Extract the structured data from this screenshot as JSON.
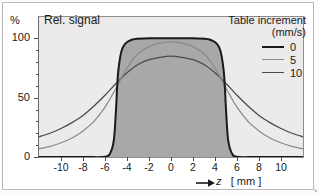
{
  "figure": {
    "y_unit_label": "%",
    "plot_title": "Rel. signal",
    "x_axis_title_symbol": "z",
    "x_axis_title_unit": "[ mm ]",
    "corner_mark": "a"
  },
  "legend": {
    "title": "Table increment",
    "unit": "(mm/s)",
    "entries": [
      {
        "label": "0",
        "color": "#1a1a1a",
        "width": 2.1
      },
      {
        "label": "5",
        "color": "#8a8a8a",
        "width": 1.5
      },
      {
        "label": "10",
        "color": "#4a4a4a",
        "width": 1.5
      }
    ]
  },
  "chart_data": {
    "type": "line",
    "title": "Rel. signal",
    "xlabel": "z [ mm ]",
    "ylabel": "%",
    "xlim": [
      -12,
      12
    ],
    "ylim": [
      0,
      118
    ],
    "grid": false,
    "legend_position": "top-right",
    "legend_title": "Table increment (mm/s)",
    "x_ticks": [
      -10,
      -8,
      -6,
      -4,
      -2,
      0,
      2,
      4,
      6,
      8,
      10
    ],
    "y_ticks": [
      0,
      50,
      100
    ],
    "y_minor_ticks": [
      10,
      20,
      30,
      40,
      60,
      70,
      80,
      90
    ],
    "fill_series": "0",
    "fill_color": "#a8a8a8",
    "panel_background": "#eceaea",
    "series": [
      {
        "name": "0",
        "color": "#1a1a1a",
        "x": [
          -12,
          -8,
          -6.2,
          -5.6,
          -5.2,
          -5.0,
          -4.8,
          -4.4,
          -3.5,
          -2,
          0,
          2,
          3.5,
          4.4,
          4.8,
          5.0,
          5.2,
          5.6,
          6.2,
          8,
          12
        ],
        "y": [
          0,
          0,
          0,
          2,
          14,
          40,
          72,
          92,
          99,
          100,
          100,
          100,
          99,
          92,
          72,
          40,
          14,
          2,
          0,
          0,
          0
        ]
      },
      {
        "name": "5",
        "color": "#8a8a8a",
        "x": [
          -12,
          -11,
          -10,
          -9,
          -8,
          -7,
          -6,
          -5,
          -4,
          -3,
          -2,
          -1,
          0,
          1,
          2,
          3,
          4,
          5,
          6,
          7,
          8,
          9,
          10,
          11,
          12
        ],
        "y": [
          7,
          9,
          12,
          16,
          22,
          30,
          42,
          58,
          75,
          87,
          93,
          96,
          97,
          96,
          93,
          87,
          75,
          58,
          42,
          30,
          22,
          16,
          12,
          9,
          7
        ]
      },
      {
        "name": "10",
        "color": "#4a4a4a",
        "x": [
          -12,
          -11,
          -10,
          -9,
          -8,
          -7,
          -6,
          -5,
          -4,
          -3,
          -2,
          -1,
          0,
          1,
          2,
          3,
          4,
          5,
          6,
          7,
          8,
          9,
          10,
          11,
          12
        ],
        "y": [
          17,
          20,
          24,
          29,
          35,
          43,
          52,
          62,
          71,
          78,
          82,
          84,
          85,
          84,
          82,
          78,
          71,
          62,
          52,
          43,
          35,
          29,
          24,
          20,
          17
        ]
      }
    ]
  }
}
